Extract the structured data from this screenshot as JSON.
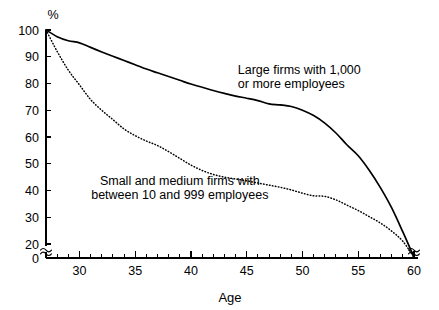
{
  "chart_data": {
    "type": "line",
    "title": "",
    "subtitle": "",
    "xlabel": "Age",
    "ylabel": "%",
    "unit_label": "%",
    "xlim": [
      27,
      60
    ],
    "ylim": [
      0,
      100
    ],
    "y_axis_break": true,
    "y_axis_break_between": [
      0,
      20
    ],
    "x_axis_break_at_end": true,
    "grid": false,
    "legend_position": "inline-annotations",
    "background_color": "#ffffff",
    "line_color": "#000000",
    "x_major_ticks": [
      30,
      35,
      40,
      45,
      50,
      55,
      60
    ],
    "x_major_tick_labels": [
      "30",
      "35",
      "40",
      "45",
      "50",
      "55",
      "60"
    ],
    "x_minor_tick_step": 1,
    "y_ticks": [
      0,
      20,
      30,
      40,
      50,
      60,
      70,
      80,
      90,
      100
    ],
    "y_tick_labels": [
      "0",
      "20",
      "30",
      "40",
      "50",
      "60",
      "70",
      "80",
      "90",
      "100"
    ],
    "series": [
      {
        "name": "Large firms with 1,000 or more employees",
        "style": "solid",
        "annotation_lines": [
          "Large firms with 1,000",
          "or more employees"
        ],
        "x": [
          27,
          28,
          29,
          30,
          31,
          32,
          33,
          34,
          35,
          36,
          37,
          38,
          39,
          40,
          41,
          42,
          43,
          44,
          45,
          46,
          47,
          48,
          49,
          50,
          51,
          52,
          53,
          54,
          55,
          56,
          57,
          58,
          59,
          60
        ],
        "values": [
          100,
          97.5,
          96.0,
          95.2,
          93.5,
          91.8,
          90.2,
          88.6,
          87.0,
          85.4,
          84.0,
          82.6,
          81.2,
          79.8,
          78.6,
          77.4,
          76.3,
          75.3,
          74.5,
          73.6,
          72.4,
          72.0,
          71.4,
          70.0,
          68.0,
          65.2,
          61.5,
          57.0,
          53.0,
          47.5,
          41.0,
          33.5,
          24.5,
          15.0
        ]
      },
      {
        "name": "Small and medium firms with between 10 and 999 employees",
        "style": "dotted",
        "annotation_lines": [
          "Small and medium firms with",
          "between 10 and 999 employees"
        ],
        "x": [
          27,
          28,
          29,
          30,
          31,
          32,
          33,
          34,
          35,
          36,
          37,
          38,
          39,
          40,
          41,
          42,
          43,
          44,
          45,
          46,
          47,
          48,
          49,
          50,
          51,
          52,
          53,
          54,
          55,
          56,
          57,
          58,
          59,
          60
        ],
        "values": [
          100,
          92.0,
          85.0,
          79.5,
          74.0,
          70.0,
          66.5,
          63.0,
          60.5,
          58.5,
          56.8,
          54.5,
          52.0,
          49.5,
          47.5,
          46.0,
          45.0,
          44.3,
          43.6,
          42.8,
          42.0,
          41.2,
          40.2,
          39.0,
          38.0,
          37.8,
          36.5,
          34.5,
          32.5,
          30.2,
          27.8,
          24.8,
          21.0,
          15.0
        ]
      }
    ],
    "annotations": [
      {
        "id": "large-firms-annotation",
        "lines": [
          "Large firms with 1,000",
          "or more employees"
        ],
        "x": 44.2,
        "y": 83.5
      },
      {
        "id": "small-medium-firms-annotation",
        "lines": [
          "Small and medium firms with",
          "between 10 and 999 employees"
        ],
        "x": 39.0,
        "y": 42.0
      }
    ]
  },
  "axes": {
    "x_title": "Age",
    "y_unit": "%"
  }
}
